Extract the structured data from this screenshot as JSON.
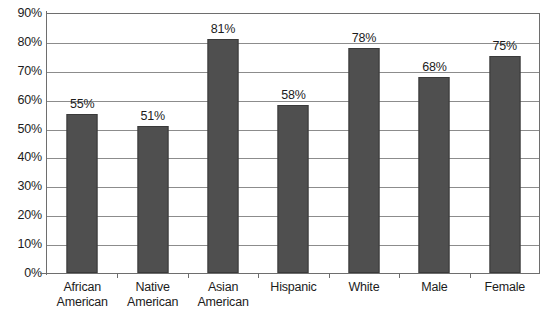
{
  "chart_data": {
    "type": "bar",
    "title": "",
    "subtitle": "",
    "xlabel": "",
    "ylabel": "",
    "categories": [
      "African American",
      "Native American",
      "Asian American",
      "Hispanic",
      "White",
      "Male",
      "Female"
    ],
    "category_lines": [
      [
        "African",
        "American"
      ],
      [
        "Native",
        "American"
      ],
      [
        "Asian",
        "American"
      ],
      [
        "Hispanic"
      ],
      [
        "White"
      ],
      [
        "Male"
      ],
      [
        "Female"
      ]
    ],
    "values": [
      55,
      51,
      81,
      58,
      78,
      68,
      75
    ],
    "data_labels": [
      "55%",
      "51%",
      "81%",
      "58%",
      "78%",
      "68%",
      "75%"
    ],
    "ylim": [
      0,
      90
    ],
    "ytick_values": [
      0,
      10,
      20,
      30,
      40,
      50,
      60,
      70,
      80,
      90
    ],
    "ytick_labels": [
      "0%",
      "10%",
      "20%",
      "30%",
      "40%",
      "50%",
      "60%",
      "70%",
      "80%",
      "90%"
    ],
    "grid": true,
    "legend": null,
    "series": [
      {
        "name": "",
        "values": [
          55,
          51,
          81,
          58,
          78,
          68,
          75
        ],
        "color": "#4f4f4f"
      }
    ]
  },
  "style": {
    "bar_fill": "#4f4f4f",
    "bar_edge": "#3a3a3a",
    "gridline_color": "#8c8c8c",
    "axis_color": "#6e6e6e",
    "text_color": "#1c1c1c",
    "background": "#ffffff"
  },
  "caption": {
    "text": ""
  }
}
